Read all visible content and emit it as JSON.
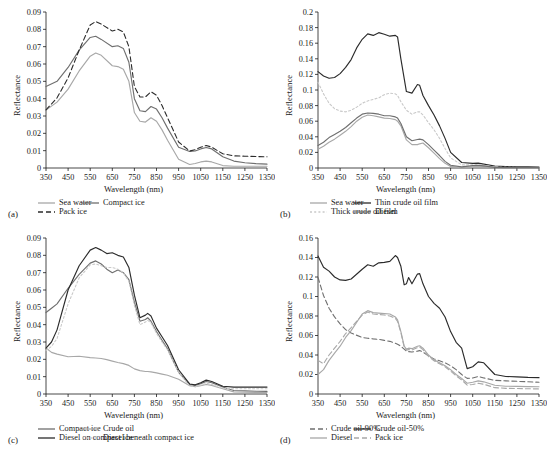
{
  "figure": {
    "axis_titles": {
      "x": "Wavelength (nm)",
      "y": "Reflectance"
    },
    "x_ticks": [
      "350",
      "450",
      "550",
      "650",
      "750",
      "850",
      "950",
      "1050",
      "1150",
      "1250",
      "1350"
    ],
    "colors": {
      "dark": "#2b2b2b",
      "mid": "#6f6f6f",
      "light": "#a8a8a8",
      "pale": "#c9c9c9"
    }
  },
  "chart_data": [
    {
      "type": "line",
      "panel": "a",
      "tag": "(a)",
      "title": "",
      "xlabel": "Wavelength (nm)",
      "ylabel": "Reflectance",
      "xlim": [
        350,
        1350
      ],
      "ylim": [
        0,
        0.09
      ],
      "ytick_step": 0.01,
      "y_ticks": [
        "0",
        "0.01",
        "0.02",
        "0.03",
        "0.04",
        "0.05",
        "0.06",
        "0.07",
        "0.08",
        "0.09"
      ],
      "x_ticks": [
        350,
        450,
        550,
        650,
        750,
        850,
        950,
        1050,
        1150,
        1250,
        1350
      ],
      "grid": false,
      "legend_position": "below",
      "x": [
        350,
        400,
        450,
        500,
        550,
        575,
        600,
        650,
        675,
        700,
        725,
        750,
        775,
        800,
        825,
        850,
        875,
        900,
        950,
        1000,
        1025,
        1050,
        1075,
        1100,
        1150,
        1200,
        1250,
        1300,
        1350
      ],
      "series": [
        {
          "name": "Sea water",
          "style": "solid",
          "color": "#a8a8a8",
          "values": [
            0.0335,
            0.038,
            0.0455,
            0.056,
            0.0645,
            0.0663,
            0.065,
            0.059,
            0.0585,
            0.057,
            0.05,
            0.032,
            0.027,
            0.0265,
            0.029,
            0.027,
            0.022,
            0.016,
            0.005,
            0.002,
            0.0026,
            0.0035,
            0.004,
            0.0035,
            0.0014,
            0.001,
            0.001,
            0.001,
            0.001
          ]
        },
        {
          "name": "Compact ice",
          "style": "solid",
          "color": "#6f6f6f",
          "values": [
            0.047,
            0.05,
            0.058,
            0.068,
            0.0753,
            0.076,
            0.0742,
            0.07,
            0.0705,
            0.069,
            0.061,
            0.04,
            0.033,
            0.0325,
            0.0355,
            0.034,
            0.029,
            0.023,
            0.012,
            0.0095,
            0.0098,
            0.011,
            0.0118,
            0.011,
            0.0065,
            0.004,
            0.003,
            0.0025,
            0.0022
          ]
        },
        {
          "name": "Pack ice",
          "style": "dashed",
          "color": "#2b2b2b",
          "values": [
            0.0335,
            0.0405,
            0.052,
            0.068,
            0.0825,
            0.0845,
            0.083,
            0.079,
            0.08,
            0.0785,
            0.07,
            0.047,
            0.041,
            0.041,
            0.044,
            0.042,
            0.036,
            0.029,
            0.015,
            0.0098,
            0.0105,
            0.012,
            0.013,
            0.012,
            0.0082,
            0.007,
            0.0068,
            0.0066,
            0.0065
          ]
        }
      ]
    },
    {
      "type": "line",
      "panel": "b",
      "tag": "(b)",
      "title": "",
      "xlabel": "Wavelength (nm)",
      "ylabel": "Reflectance",
      "xlim": [
        350,
        1350
      ],
      "ylim": [
        0,
        0.2
      ],
      "ytick_step": 0.02,
      "y_ticks": [
        "0",
        "0.02",
        "0.04",
        "0.06",
        "0.08",
        "0.1",
        "0.12",
        "0.14",
        "0.16",
        "0.18",
        "0.2"
      ],
      "x_ticks": [
        350,
        450,
        550,
        650,
        750,
        850,
        950,
        1050,
        1150,
        1250,
        1350
      ],
      "grid": false,
      "legend_position": "below",
      "x": [
        350,
        375,
        400,
        425,
        450,
        475,
        500,
        525,
        550,
        575,
        600,
        625,
        650,
        675,
        700,
        710,
        725,
        750,
        775,
        800,
        810,
        825,
        850,
        875,
        900,
        925,
        950,
        1000,
        1050,
        1075,
        1100,
        1150,
        1200,
        1250,
        1300,
        1350
      ],
      "series": [
        {
          "name": "Sea water",
          "style": "solid",
          "color": "#a8a8a8",
          "values": [
            0.024,
            0.028,
            0.033,
            0.037,
            0.042,
            0.047,
            0.053,
            0.06,
            0.065,
            0.068,
            0.067,
            0.0655,
            0.064,
            0.0635,
            0.062,
            0.06,
            0.054,
            0.036,
            0.03,
            0.03,
            0.031,
            0.032,
            0.026,
            0.019,
            0.012,
            0.006,
            0.002,
            0.0005,
            0.0015,
            0.002,
            0.0018,
            0.0005,
            0.0003,
            0.0003,
            0.0003,
            0.0003
          ]
        },
        {
          "name": "Thin crude oil film",
          "style": "solid",
          "color": "#2b2b2b",
          "values": [
            0.1235,
            0.118,
            0.115,
            0.116,
            0.121,
            0.129,
            0.139,
            0.154,
            0.165,
            0.172,
            0.17,
            0.1735,
            0.1715,
            0.169,
            0.17,
            0.168,
            0.14,
            0.098,
            0.096,
            0.107,
            0.106,
            0.093,
            0.08,
            0.068,
            0.054,
            0.038,
            0.02,
            0.007,
            0.006,
            0.0062,
            0.005,
            0.0025,
            0.0018,
            0.0015,
            0.0014,
            0.0013
          ]
        },
        {
          "name": "Thick crude oil film",
          "style": "dotted",
          "color": "#c9c9c9",
          "values": [
            0.11,
            0.095,
            0.083,
            0.076,
            0.073,
            0.072,
            0.074,
            0.078,
            0.083,
            0.086,
            0.088,
            0.09,
            0.094,
            0.096,
            0.095,
            0.093,
            0.085,
            0.074,
            0.069,
            0.072,
            0.072,
            0.068,
            0.058,
            0.049,
            0.038,
            0.025,
            0.013,
            0.004,
            0.004,
            0.0042,
            0.0035,
            0.0012,
            0.0008,
            0.0007,
            0.0006,
            0.0006
          ]
        },
        {
          "name": "Diesel",
          "style": "solid",
          "color": "#6f6f6f",
          "values": [
            0.029,
            0.033,
            0.039,
            0.043,
            0.047,
            0.052,
            0.058,
            0.064,
            0.069,
            0.0705,
            0.07,
            0.069,
            0.067,
            0.067,
            0.0655,
            0.064,
            0.057,
            0.04,
            0.035,
            0.0365,
            0.037,
            0.036,
            0.03,
            0.023,
            0.016,
            0.0085,
            0.0035,
            0.0015,
            0.003,
            0.0035,
            0.0028,
            0.0008,
            0.0005,
            0.0004,
            0.0004,
            0.0004
          ]
        }
      ]
    },
    {
      "type": "line",
      "panel": "c",
      "tag": "(c)",
      "title": "",
      "xlabel": "Wavelength (nm)",
      "ylabel": "Reflectance",
      "xlim": [
        350,
        1350
      ],
      "ylim": [
        0,
        0.09
      ],
      "ytick_step": 0.01,
      "y_ticks": [
        "0",
        "0.01",
        "0.02",
        "0.03",
        "0.04",
        "0.05",
        "0.06",
        "0.07",
        "0.08",
        "0.09"
      ],
      "x_ticks": [
        350,
        450,
        550,
        650,
        750,
        850,
        950,
        1050,
        1150,
        1250,
        1350
      ],
      "grid": false,
      "legend_position": "below",
      "x": [
        350,
        375,
        400,
        450,
        500,
        550,
        575,
        600,
        625,
        650,
        675,
        700,
        725,
        750,
        775,
        800,
        810,
        825,
        850,
        875,
        900,
        950,
        1000,
        1025,
        1050,
        1075,
        1100,
        1150,
        1200,
        1250,
        1300,
        1350
      ],
      "series": [
        {
          "name": "Compact ice",
          "style": "solid",
          "color": "#6f6f6f",
          "values": [
            0.047,
            0.0495,
            0.052,
            0.061,
            0.069,
            0.0755,
            0.0768,
            0.075,
            0.072,
            0.07,
            0.0715,
            0.07,
            0.066,
            0.053,
            0.042,
            0.043,
            0.044,
            0.042,
            0.036,
            0.031,
            0.026,
            0.0125,
            0.0055,
            0.005,
            0.006,
            0.0072,
            0.0065,
            0.004,
            0.002,
            0.0018,
            0.0016,
            0.0015
          ]
        },
        {
          "name": "Crude oil",
          "style": "solid",
          "color": "#a8a8a8",
          "values": [
            0.0265,
            0.024,
            0.023,
            0.0215,
            0.0218,
            0.021,
            0.0208,
            0.0205,
            0.0198,
            0.019,
            0.0182,
            0.0175,
            0.0165,
            0.0145,
            0.0135,
            0.013,
            0.013,
            0.0128,
            0.0122,
            0.0115,
            0.0108,
            0.0085,
            0.0048,
            0.0042,
            0.0048,
            0.0055,
            0.005,
            0.003,
            0.0012,
            0.001,
            0.0009,
            0.0008
          ]
        },
        {
          "name": "Diesel on compact ice",
          "style": "solid",
          "color": "#2b2b2b",
          "values": [
            0.0265,
            0.03,
            0.037,
            0.06,
            0.074,
            0.083,
            0.0845,
            0.083,
            0.081,
            0.0815,
            0.08,
            0.079,
            0.073,
            0.057,
            0.044,
            0.0455,
            0.0465,
            0.045,
            0.038,
            0.033,
            0.028,
            0.014,
            0.0058,
            0.0053,
            0.0065,
            0.008,
            0.0072,
            0.0045,
            0.004,
            0.004,
            0.004,
            0.004
          ]
        },
        {
          "name": "Diesel beneath compact ice",
          "style": "dotted",
          "color": "#c9c9c9",
          "values": [
            0.025,
            0.0275,
            0.032,
            0.052,
            0.067,
            0.0745,
            0.075,
            0.074,
            0.073,
            0.073,
            0.072,
            0.07,
            0.065,
            0.051,
            0.04,
            0.0415,
            0.0425,
            0.041,
            0.035,
            0.03,
            0.0255,
            0.0125,
            0.0045,
            0.0042,
            0.005,
            0.0062,
            0.0055,
            0.0032,
            0.003,
            0.003,
            0.003,
            0.003
          ]
        }
      ]
    },
    {
      "type": "line",
      "panel": "d",
      "tag": "(d)",
      "title": "",
      "xlabel": "Wavelength (nm)",
      "ylabel": "Reflectance",
      "xlim": [
        350,
        1350
      ],
      "ylim": [
        0,
        0.16
      ],
      "ytick_step": 0.02,
      "y_ticks": [
        "0",
        "0.02",
        "0.04",
        "0.06",
        "0.08",
        "0.1",
        "0.12",
        "0.14",
        "0.16"
      ],
      "x_ticks": [
        350,
        450,
        550,
        650,
        750,
        850,
        950,
        1050,
        1150,
        1250,
        1350
      ],
      "grid": false,
      "legend_position": "below",
      "x": [
        350,
        375,
        400,
        425,
        450,
        475,
        500,
        550,
        575,
        600,
        625,
        650,
        675,
        700,
        710,
        725,
        740,
        750,
        760,
        775,
        800,
        810,
        825,
        850,
        875,
        900,
        925,
        950,
        975,
        1000,
        1025,
        1050,
        1075,
        1100,
        1150,
        1200,
        1250,
        1300,
        1350
      ],
      "series": [
        {
          "name": "Crude oil-90%",
          "style": "dashed",
          "color": "#6f6f6f",
          "values": [
            0.1195,
            0.101,
            0.088,
            0.079,
            0.072,
            0.066,
            0.0625,
            0.058,
            0.0572,
            0.0565,
            0.056,
            0.055,
            0.054,
            0.052,
            0.051,
            0.049,
            0.046,
            0.044,
            0.0435,
            0.043,
            0.044,
            0.0445,
            0.043,
            0.039,
            0.036,
            0.034,
            0.032,
            0.029,
            0.025,
            0.02,
            0.016,
            0.0165,
            0.018,
            0.0165,
            0.014,
            0.0135,
            0.013,
            0.0125,
            0.012
          ]
        },
        {
          "name": "Crude oil-50%",
          "style": "solid",
          "color": "#2b2b2b",
          "values": [
            0.1415,
            0.13,
            0.126,
            0.12,
            0.117,
            0.1165,
            0.118,
            0.128,
            0.1325,
            0.131,
            0.1345,
            0.135,
            0.136,
            0.142,
            0.14,
            0.131,
            0.112,
            0.113,
            0.1195,
            0.113,
            0.123,
            0.1235,
            0.113,
            0.1,
            0.093,
            0.088,
            0.079,
            0.064,
            0.053,
            0.047,
            0.026,
            0.028,
            0.033,
            0.032,
            0.02,
            0.018,
            0.0175,
            0.017,
            0.0168
          ]
        },
        {
          "name": "Diesel",
          "style": "solid",
          "color": "#a8a8a8",
          "values": [
            0.02,
            0.025,
            0.0345,
            0.042,
            0.049,
            0.058,
            0.065,
            0.082,
            0.0855,
            0.0835,
            0.083,
            0.0825,
            0.082,
            0.079,
            0.076,
            0.064,
            0.049,
            0.046,
            0.047,
            0.0465,
            0.049,
            0.0495,
            0.047,
            0.04,
            0.035,
            0.032,
            0.029,
            0.025,
            0.02,
            0.016,
            0.011,
            0.012,
            0.0135,
            0.0125,
            0.009,
            0.008,
            0.0078,
            0.0076,
            0.0074
          ]
        },
        {
          "name": "Pack ice",
          "style": "dashed",
          "color": "#a8a8a8",
          "values": [
            0.0345,
            0.031,
            0.04,
            0.047,
            0.054,
            0.062,
            0.068,
            0.081,
            0.084,
            0.082,
            0.0815,
            0.081,
            0.08,
            0.0775,
            0.0745,
            0.063,
            0.048,
            0.045,
            0.0455,
            0.045,
            0.0475,
            0.048,
            0.0455,
            0.0385,
            0.034,
            0.031,
            0.028,
            0.0235,
            0.0185,
            0.0145,
            0.009,
            0.0098,
            0.011,
            0.01,
            0.0065,
            0.0058,
            0.0056,
            0.0054,
            0.0052
          ]
        }
      ]
    }
  ]
}
